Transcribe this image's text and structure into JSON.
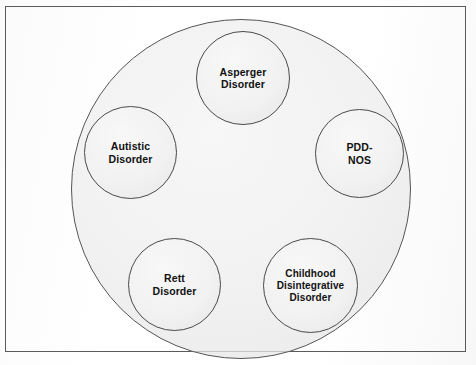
{
  "figure": {
    "type": "venn-umbrella-diagram",
    "frame": {
      "border_color": "#4c4c4c",
      "background_color": "#ffffff"
    },
    "outer_circle": {
      "name": "pervasive-developmental-disorders-umbrella",
      "fill_color": "#f1f1f1",
      "stroke_color": "#555555",
      "label": ""
    },
    "subtypes": [
      {
        "id": "asperger",
        "label": "Asperger\nDisorder",
        "position": "top",
        "fill_color": "#f1f1f1",
        "stroke_color": "#4a4a4a"
      },
      {
        "id": "pdd-nos",
        "label": "PDD-\nNOS",
        "position": "right",
        "fill_color": "#f1f1f1",
        "stroke_color": "#4a4a4a"
      },
      {
        "id": "autistic",
        "label": "Autistic\nDisorder",
        "position": "left",
        "fill_color": "#f1f1f1",
        "stroke_color": "#4a4a4a"
      },
      {
        "id": "rett",
        "label": "Rett\nDisorder",
        "position": "bottom-left",
        "fill_color": "#f1f1f1",
        "stroke_color": "#4a4a4a"
      },
      {
        "id": "childhood-disintegrative",
        "label": "Childhood\nDisintegrative\nDisorder",
        "position": "bottom-right",
        "fill_color": "#f1f1f1",
        "stroke_color": "#4a4a4a"
      }
    ]
  }
}
